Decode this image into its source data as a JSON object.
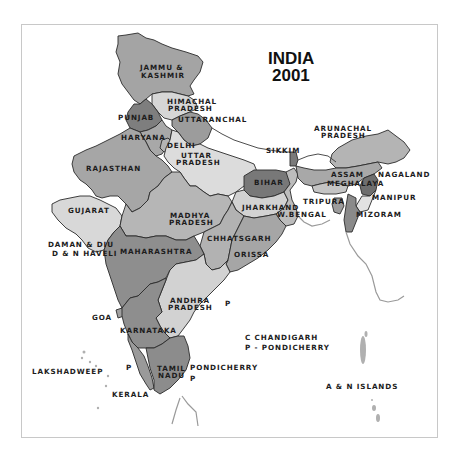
{
  "title": {
    "line1": "INDIA",
    "line2": "2001"
  },
  "colors": {
    "background": "#ffffff",
    "frame": "#c8c8c8",
    "shade_dark": "#6e6e6e",
    "shade_mid_dark": "#8a8a8a",
    "shade_mid": "#a8a8a8",
    "shade_light": "#d4d4d4",
    "shade_very_light": "#e6e6e6",
    "border": "#2a2a2a"
  },
  "states": [
    {
      "name": "JAMMU & KASHMIR",
      "line1": "JAMMU &",
      "line2": "KASHMIR",
      "shade": "#a4a4a4"
    },
    {
      "name": "HIMACHAL PRADESH",
      "line1": "HIMACHAL",
      "line2": "PRADESH",
      "shade": "#d6d6d6"
    },
    {
      "name": "PUNJAB",
      "line1": "PUNJAB",
      "shade": "#7e7e7e"
    },
    {
      "name": "UTTARANCHAL",
      "line1": "UTTARANCHAL",
      "shade": "#9c9c9c"
    },
    {
      "name": "HARYANA",
      "line1": "HARYANA",
      "shade": "#a8a8a8"
    },
    {
      "name": "DELHI",
      "line1": "DELHI",
      "shade": "#b4b4b4"
    },
    {
      "name": "RAJASTHAN",
      "line1": "RAJASTHAN",
      "shade": "#a6a6a6"
    },
    {
      "name": "UTTAR PRADESH",
      "line1": "UTTAR",
      "line2": "PRADESH",
      "shade": "#dcdcdc"
    },
    {
      "name": "SIKKIM",
      "line1": "SIKKIM",
      "shade": "#7a7a7a"
    },
    {
      "name": "ARUNACHAL PRADESH",
      "line1": "ARUNACHAL",
      "line2": "PRADESH",
      "shade": "#b4b4b4"
    },
    {
      "name": "BIHAR",
      "line1": "BIHAR",
      "shade": "#787878"
    },
    {
      "name": "ASSAM",
      "line1": "ASSAM",
      "shade": "#a8a8a8"
    },
    {
      "name": "NAGALAND",
      "line1": "NAGALAND",
      "shade": "#6e6e6e"
    },
    {
      "name": "MEGHALAYA",
      "line1": "MEGHALAYA",
      "shade": "#c4c4c4"
    },
    {
      "name": "MANIPUR",
      "line1": "MANIPUR",
      "shade": "#e2e2e2"
    },
    {
      "name": "TRIPURA",
      "line1": "TRIPURA",
      "shade": "#9c9c9c"
    },
    {
      "name": "MIZORAM",
      "line1": "MIZORAM",
      "shade": "#8a8a8a"
    },
    {
      "name": "JHARKHAND",
      "line1": "JHARKHAND",
      "shade": "#d2d2d2"
    },
    {
      "name": "W.BENGAL",
      "line1": "W.BENGAL",
      "shade": "#bcbcbc"
    },
    {
      "name": "GUJARAT",
      "line1": "GUJARAT",
      "shade": "#d8d8d8"
    },
    {
      "name": "MADHYA PRADESH",
      "line1": "MADHYA",
      "line2": "PRADESH",
      "shade": "#b6b6b6"
    },
    {
      "name": "CHHATTISGARH",
      "line1": "CHHATSGARH",
      "shade": "#b2b2b2"
    },
    {
      "name": "ORISSA",
      "line1": "ORISSA",
      "shade": "#a6a6a6"
    },
    {
      "name": "DAMAN & DIU / D & N HAVELI",
      "line1": "DAMAN & DIU",
      "line2": "D & N HAVELI",
      "shade": "#cfcfcf"
    },
    {
      "name": "MAHARASHTRA",
      "line1": "MAHARASHTRA",
      "shade": "#8e8e8e"
    },
    {
      "name": "ANDHRA PRADESH",
      "line1": "ANDHRA",
      "line2": "PRADESH",
      "shade": "#d2d2d2"
    },
    {
      "name": "GOA",
      "line1": "GOA",
      "shade": "#a0a0a0"
    },
    {
      "name": "KARNATAKA",
      "line1": "KARNATAKA",
      "shade": "#8e8e8e"
    },
    {
      "name": "TAMIL NADU",
      "line1": "TAMIL",
      "line2": "NADU",
      "shade": "#8c8c8c"
    },
    {
      "name": "KERALA",
      "line1": "KERALA",
      "shade": "#9a9a9a"
    }
  ],
  "other_labels": {
    "lakshadweep": "LAKSHADWEEP",
    "pondicherry": "PONDICHERRY",
    "an_islands": "A & N ISLANDS",
    "p_marker_1": "P",
    "p_marker_2": "P",
    "p_marker_3": "P",
    "c_marker": "C"
  },
  "legend": {
    "items": [
      {
        "key": "C",
        "label": "C  CHANDIGARH"
      },
      {
        "key": "P",
        "label": "P - PONDICHERRY"
      }
    ]
  }
}
